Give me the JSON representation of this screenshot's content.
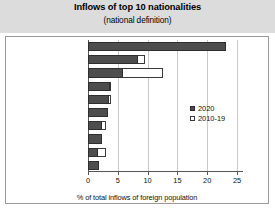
{
  "chart_data": {
    "type": "bar",
    "orientation": "horizontal",
    "title": "Inflows of top 10 nationalities",
    "subtitle": "(national definition)",
    "xlabel": "% of total inflows of foreign population",
    "ylabel": "",
    "xlim": [
      0,
      26
    ],
    "xticks": [
      0,
      5,
      10,
      15,
      20,
      25
    ],
    "xtick_labels": [
      "0",
      "5",
      "10",
      "15",
      "20",
      "25"
    ],
    "grid": true,
    "grid_axis": "x",
    "legend_position": "center-right",
    "categories": [
      "India",
      "China",
      "Philippines",
      "United States",
      "Nigeria",
      "Pakistan",
      "Syria",
      "France",
      "Iran",
      "Brazil"
    ],
    "series": [
      {
        "name": "2020",
        "style": "filled",
        "color": "#4d4d4d",
        "values": [
          23.2,
          8.4,
          5.8,
          3.7,
          3.5,
          3.4,
          2.4,
          2.3,
          1.6,
          1.9
        ]
      },
      {
        "name": "2010-19",
        "style": "hollow",
        "color": "#ffffff",
        "values": [
          15.6,
          9.5,
          12.6,
          3.9,
          3.9,
          3.4,
          3.0,
          2.3,
          3.1,
          1.9
        ]
      }
    ]
  },
  "legend": {
    "items": [
      {
        "label": "2020",
        "style": "filled"
      },
      {
        "label": "2010-19",
        "style": "hollow"
      }
    ]
  }
}
